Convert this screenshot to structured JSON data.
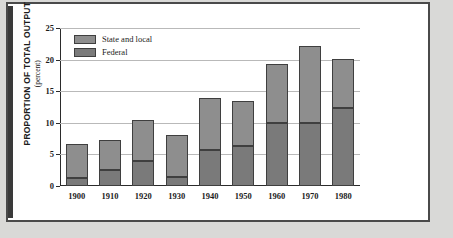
{
  "chart_data": {
    "type": "bar",
    "title": "",
    "xlabel": "",
    "ylabel": "PROPORTION OF TOTAL OUTPUT",
    "ylabel_sub": "(percent)",
    "ylim": [
      0,
      25
    ],
    "yticks": [
      0,
      5,
      10,
      15,
      20,
      25
    ],
    "grid": true,
    "stacked": true,
    "legend_position": "top-left",
    "categories": [
      "1900",
      "1910",
      "1920",
      "1930",
      "1940",
      "1950",
      "1960",
      "1970",
      "1980"
    ],
    "series": [
      {
        "name": "Federal",
        "color": "#7a7a7a",
        "values": [
          1.2,
          2.5,
          3.9,
          1.4,
          5.7,
          6.4,
          10.0,
          9.9,
          12.3
        ]
      },
      {
        "name": "State and local",
        "color": "#8e8e8e",
        "values": [
          5.4,
          4.8,
          6.5,
          6.7,
          8.3,
          7.1,
          9.3,
          12.2,
          7.8
        ]
      }
    ],
    "totals": [
      6.6,
      7.3,
      10.4,
      8.1,
      14.0,
      13.5,
      19.3,
      22.1,
      20.1
    ]
  },
  "legend": {
    "items": [
      {
        "label": "State and local",
        "color": "#8e8e8e"
      },
      {
        "label": "Federal",
        "color": "#7a7a7a"
      }
    ]
  },
  "colors": {
    "page_background": "#d9d9d7",
    "canvas": "#ffffff",
    "frame": "#4a4a4a",
    "axis": "#2b2b2b",
    "gridline": "#b9b9b9"
  }
}
